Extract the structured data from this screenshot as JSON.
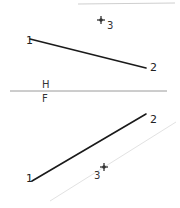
{
  "diagram": {
    "type": "orthographic-projection",
    "fold_line": {
      "upper_label": "H",
      "lower_label": "F",
      "x1": 10,
      "y1": 91,
      "x2": 167,
      "y2": 91,
      "color": "#9a9a9a"
    },
    "top_view": {
      "line": {
        "x1": 30,
        "y1": 39,
        "x2": 146,
        "y2": 68,
        "color": "#1a1a1a"
      },
      "points": [
        {
          "label": "1",
          "x": 26,
          "y": 44
        },
        {
          "label": "2",
          "x": 150,
          "y": 71
        },
        {
          "label": "3",
          "x": 107,
          "y": 29,
          "marker_x": 101,
          "marker_y": 20
        }
      ],
      "faint_edge": {
        "x1": 78,
        "y1": 4,
        "x2": 175,
        "y2": 3,
        "color": "#cfcfcf"
      }
    },
    "front_view": {
      "line": {
        "x1": 32,
        "y1": 181,
        "x2": 146,
        "y2": 114,
        "color": "#1a1a1a"
      },
      "points": [
        {
          "label": "1",
          "x": 26,
          "y": 182
        },
        {
          "label": "2",
          "x": 150,
          "y": 123
        },
        {
          "label": "3",
          "x": 94,
          "y": 179,
          "marker_x": 104,
          "marker_y": 167
        }
      ],
      "faint_line": {
        "x1": 50,
        "y1": 201,
        "x2": 176,
        "y2": 122,
        "color": "#e2e2e2"
      }
    }
  }
}
